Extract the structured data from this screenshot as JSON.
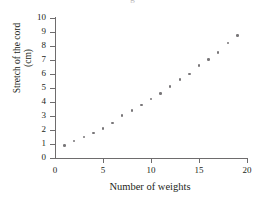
{
  "title_fragment": "g",
  "chart_data": {
    "type": "scatter",
    "title": "",
    "xlabel": "Number of weights",
    "ylabel_line1": "Stretch of the cord",
    "ylabel_line2": "(cm)",
    "ylabel": "Stretch of the cord (cm)",
    "xlim": [
      0,
      20
    ],
    "ylim": [
      0,
      10
    ],
    "xticks": [
      0,
      5,
      10,
      15,
      20
    ],
    "yticks": [
      0,
      1,
      2,
      3,
      4,
      5,
      6,
      7,
      8,
      9,
      10
    ],
    "xtick_labels": [
      "0",
      "5",
      "10",
      "15",
      "20"
    ],
    "ytick_labels": [
      "0",
      "1",
      "2",
      "3",
      "4",
      "5",
      "6",
      "7",
      "8",
      "9",
      "10"
    ],
    "grid": false,
    "legend": false,
    "marker_color": "#787678",
    "axis_color": "#6e6c6d",
    "x": [
      1,
      2,
      3,
      4,
      5,
      6,
      7,
      8,
      9,
      10,
      11,
      12,
      13,
      14,
      15,
      16,
      17,
      18,
      19
    ],
    "y": [
      0.9,
      1.2,
      1.5,
      1.8,
      2.1,
      2.5,
      3.05,
      3.4,
      3.8,
      4.2,
      4.6,
      5.1,
      5.6,
      6.0,
      6.6,
      7.05,
      7.55,
      8.2,
      8.75
    ],
    "points": [
      {
        "x": 1,
        "y": 0.9
      },
      {
        "x": 2,
        "y": 1.2
      },
      {
        "x": 3,
        "y": 1.5
      },
      {
        "x": 4,
        "y": 1.8
      },
      {
        "x": 5,
        "y": 2.1
      },
      {
        "x": 6,
        "y": 2.5
      },
      {
        "x": 7,
        "y": 3.05
      },
      {
        "x": 8,
        "y": 3.4
      },
      {
        "x": 9,
        "y": 3.8
      },
      {
        "x": 10,
        "y": 4.2
      },
      {
        "x": 11,
        "y": 4.6
      },
      {
        "x": 12,
        "y": 5.1
      },
      {
        "x": 13,
        "y": 5.6
      },
      {
        "x": 14,
        "y": 6.0
      },
      {
        "x": 15,
        "y": 6.6
      },
      {
        "x": 16,
        "y": 7.05
      },
      {
        "x": 17,
        "y": 7.55
      },
      {
        "x": 18,
        "y": 8.2
      },
      {
        "x": 19,
        "y": 8.75
      }
    ]
  }
}
